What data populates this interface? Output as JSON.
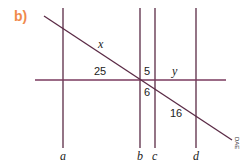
{
  "part_label": "b)",
  "part_label_color": "#f08a4b",
  "line_color": "#5a2a45",
  "transversal_label": "x",
  "vertical_lines": [
    {
      "label": "a"
    },
    {
      "label": "b"
    },
    {
      "label": "c"
    },
    {
      "label": "d"
    }
  ],
  "segment_labels": {
    "x": "x",
    "left_of_b": "25",
    "between_b_c_top": "5",
    "between_c_d_top": "y",
    "between_b_c_bottom": "6",
    "between_c_d_bottom": "16"
  },
  "watermark": "DAE"
}
